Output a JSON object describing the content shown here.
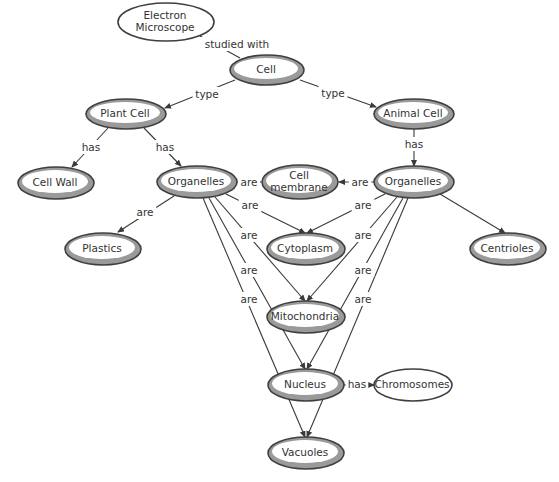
{
  "diagram": {
    "type": "concept-map",
    "colors": {
      "node_ring": "#9a9a9a",
      "node_border": "#3f3f3f",
      "edge": "#3a3a3a",
      "text": "#333333"
    },
    "nodes": [
      {
        "id": "electron-microscope",
        "lines": [
          "Electron",
          "Microscope"
        ],
        "cx": 166,
        "cy": 22,
        "rx": 48,
        "ry": 19,
        "style": "plain"
      },
      {
        "id": "cell",
        "lines": [
          "Cell"
        ],
        "cx": 267,
        "cy": 70,
        "rx": 37,
        "ry": 15,
        "style": "ring"
      },
      {
        "id": "plant-cell",
        "lines": [
          "Plant Cell"
        ],
        "cx": 126,
        "cy": 114,
        "rx": 40,
        "ry": 15,
        "style": "ring"
      },
      {
        "id": "animal-cell",
        "lines": [
          "Animal Cell"
        ],
        "cx": 414,
        "cy": 114,
        "rx": 40,
        "ry": 15,
        "style": "ring"
      },
      {
        "id": "cell-wall",
        "lines": [
          "Cell Wall"
        ],
        "cx": 56,
        "cy": 183,
        "rx": 38,
        "ry": 16,
        "style": "ring"
      },
      {
        "id": "organelles-plant",
        "lines": [
          "Organelles"
        ],
        "cx": 197,
        "cy": 182,
        "rx": 40,
        "ry": 16,
        "style": "ring"
      },
      {
        "id": "cell-membrane",
        "lines": [
          "Cell",
          "membrane"
        ],
        "cx": 300,
        "cy": 182,
        "rx": 38,
        "ry": 17,
        "style": "ring"
      },
      {
        "id": "organelles-animal",
        "lines": [
          "Organelles"
        ],
        "cx": 414,
        "cy": 182,
        "rx": 40,
        "ry": 16,
        "style": "ring"
      },
      {
        "id": "plastics",
        "lines": [
          "Plastics"
        ],
        "cx": 103,
        "cy": 249,
        "rx": 38,
        "ry": 16,
        "style": "ring"
      },
      {
        "id": "cytoplasm",
        "lines": [
          "Cytoplasm"
        ],
        "cx": 306,
        "cy": 249,
        "rx": 39,
        "ry": 16,
        "style": "ring"
      },
      {
        "id": "centrioles",
        "lines": [
          "Centrioles"
        ],
        "cx": 508,
        "cy": 249,
        "rx": 38,
        "ry": 16,
        "style": "ring"
      },
      {
        "id": "mitochondria",
        "lines": [
          "Mitochondria"
        ],
        "cx": 306,
        "cy": 317,
        "rx": 39,
        "ry": 16,
        "style": "ring"
      },
      {
        "id": "nucleus",
        "lines": [
          "Nucleus"
        ],
        "cx": 306,
        "cy": 385,
        "rx": 38,
        "ry": 16,
        "style": "ring"
      },
      {
        "id": "chromosomes",
        "lines": [
          "Chromosomes"
        ],
        "cx": 413,
        "cy": 385,
        "rx": 39,
        "ry": 16,
        "style": "plain"
      },
      {
        "id": "vacuoles",
        "lines": [
          "Vacuoles"
        ],
        "cx": 306,
        "cy": 453,
        "rx": 38,
        "ry": 16,
        "style": "ring"
      }
    ],
    "edges": [
      {
        "from": "cell",
        "to": "electron-microscope",
        "label": "studied with",
        "x1": 240,
        "y1": 58,
        "x2": 200,
        "y2": 36,
        "lx": 237,
        "ly": 44,
        "arrow": false
      },
      {
        "from": "cell",
        "to": "plant-cell",
        "label": "type",
        "x1": 235,
        "y1": 80,
        "x2": 165,
        "y2": 108,
        "lx": 207,
        "ly": 94,
        "arrow": true
      },
      {
        "from": "cell",
        "to": "animal-cell",
        "label": "type",
        "x1": 300,
        "y1": 80,
        "x2": 376,
        "y2": 107,
        "lx": 333,
        "ly": 93,
        "arrow": true
      },
      {
        "from": "plant-cell",
        "to": "cell-wall",
        "label": "has",
        "x1": 108,
        "y1": 128,
        "x2": 72,
        "y2": 167,
        "lx": 91,
        "ly": 147,
        "arrow": true
      },
      {
        "from": "plant-cell",
        "to": "organelles-plant",
        "label": "has",
        "x1": 144,
        "y1": 128,
        "x2": 181,
        "y2": 166,
        "lx": 165,
        "ly": 147,
        "arrow": true
      },
      {
        "from": "organelles-animal",
        "to": "cell-membrane",
        "label": "are",
        "x1": 374,
        "y1": 182,
        "x2": 339,
        "y2": 182,
        "lx": 360,
        "ly": 182,
        "arrow": true
      },
      {
        "from": "organelles-plant",
        "to": "cell-membrane",
        "label": "are",
        "x1": 237,
        "y1": 182,
        "x2": 261,
        "y2": 182,
        "lx": 249,
        "ly": 182,
        "arrow": true
      },
      {
        "from": "animal-cell",
        "to": "organelles-animal",
        "label": "has",
        "x1": 414,
        "y1": 129,
        "x2": 414,
        "y2": 166,
        "lx": 414,
        "ly": 144,
        "arrow": true
      },
      {
        "from": "organelles-plant",
        "to": "plastics",
        "label": "are",
        "x1": 174,
        "y1": 196,
        "x2": 118,
        "y2": 232,
        "lx": 145,
        "ly": 212,
        "arrow": true
      },
      {
        "from": "organelles-plant",
        "to": "cytoplasm",
        "label": "are",
        "x1": 226,
        "y1": 194,
        "x2": 305,
        "y2": 233,
        "lx": 250,
        "ly": 205,
        "arrow": true
      },
      {
        "from": "organelles-animal",
        "to": "cytoplasm",
        "label": "are",
        "x1": 385,
        "y1": 194,
        "x2": 307,
        "y2": 233,
        "lx": 363,
        "ly": 205,
        "arrow": true
      },
      {
        "from": "organelles-animal",
        "to": "centrioles",
        "label": "",
        "x1": 440,
        "y1": 194,
        "x2": 505,
        "y2": 233,
        "lx": 0,
        "ly": 0,
        "arrow": true
      },
      {
        "from": "organelles-plant",
        "to": "mitochondria",
        "label": "are",
        "x1": 215,
        "y1": 197,
        "x2": 305,
        "y2": 301,
        "lx": 249,
        "ly": 235,
        "arrow": true
      },
      {
        "from": "organelles-animal",
        "to": "mitochondria",
        "label": "are",
        "x1": 397,
        "y1": 197,
        "x2": 307,
        "y2": 301,
        "lx": 363,
        "ly": 235,
        "arrow": true
      },
      {
        "from": "organelles-plant",
        "to": "nucleus",
        "label": "are",
        "x1": 209,
        "y1": 198,
        "x2": 305,
        "y2": 369,
        "lx": 249,
        "ly": 270,
        "arrow": true
      },
      {
        "from": "organelles-animal",
        "to": "nucleus",
        "label": "are",
        "x1": 403,
        "y1": 198,
        "x2": 307,
        "y2": 369,
        "lx": 363,
        "ly": 270,
        "arrow": true
      },
      {
        "from": "organelles-plant",
        "to": "vacuoles",
        "label": "are",
        "x1": 203,
        "y1": 198,
        "x2": 305,
        "y2": 437,
        "lx": 249,
        "ly": 299,
        "arrow": true
      },
      {
        "from": "organelles-animal",
        "to": "vacuoles",
        "label": "are",
        "x1": 408,
        "y1": 198,
        "x2": 307,
        "y2": 437,
        "lx": 363,
        "ly": 299,
        "arrow": true
      },
      {
        "from": "nucleus",
        "to": "chromosomes",
        "label": "has",
        "x1": 344,
        "y1": 385,
        "x2": 374,
        "y2": 385,
        "lx": 357,
        "ly": 384,
        "arrow": true
      }
    ]
  }
}
